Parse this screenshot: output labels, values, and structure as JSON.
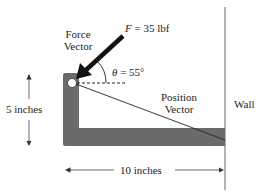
{
  "diagram": {
    "force_label_line1": "Force",
    "force_label_line2": "Vector",
    "force_equation_var": "F",
    "force_equation_rest": " = 35 lbf",
    "angle_var": "θ",
    "angle_rest": " = 55°",
    "position_label_line1": "Position",
    "position_label_line2": "Vector",
    "wall_label": "Wall",
    "height_label": "5 inches",
    "width_label": "10 inches",
    "force_magnitude": "35 lbf",
    "angle": "55°",
    "colors": {
      "bracket": "#6b6b6b",
      "wall": "#9a9a9a",
      "arrow": "#111111",
      "dimension": "#555555"
    }
  }
}
